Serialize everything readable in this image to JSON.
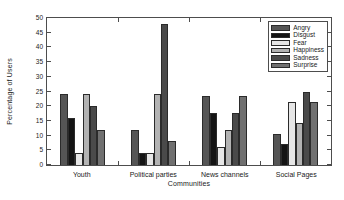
{
  "chart_data": {
    "type": "bar",
    "title": "",
    "xlabel": "Communities",
    "ylabel": "Percentage of Users",
    "categories": [
      "Youth",
      "Political parties",
      "News channels",
      "Social Pages"
    ],
    "ylim": [
      0,
      50
    ],
    "yticks": [
      0,
      5,
      10,
      15,
      20,
      25,
      30,
      35,
      40,
      45,
      50
    ],
    "ytick_labels": [
      "0",
      "5",
      "10",
      "15",
      "20",
      "25",
      "30",
      "35",
      "40",
      "45",
      "50"
    ],
    "grid": false,
    "legend_position": "top-right",
    "series": [
      {
        "name": "Angry",
        "color": "#555555",
        "values": [
          24.0,
          12.0,
          23.5,
          10.7
        ]
      },
      {
        "name": "Disgust",
        "color": "#141414",
        "values": [
          16.0,
          4.0,
          17.6,
          7.2
        ]
      },
      {
        "name": "Fear",
        "color": "#e6e6e6",
        "values": [
          4.0,
          4.0,
          6.0,
          21.3
        ]
      },
      {
        "name": "Happiness",
        "color": "#b3b3b3",
        "values": [
          24.0,
          24.0,
          11.8,
          14.2
        ]
      },
      {
        "name": "Sadness",
        "color": "#4a4a4a",
        "values": [
          20.0,
          48.0,
          17.6,
          25.0
        ]
      },
      {
        "name": "Surprise",
        "color": "#707070",
        "values": [
          12.0,
          8.0,
          23.5,
          21.4
        ]
      }
    ]
  },
  "axes": {
    "border_color": "#4d4d4d",
    "background": "#ffffff"
  }
}
